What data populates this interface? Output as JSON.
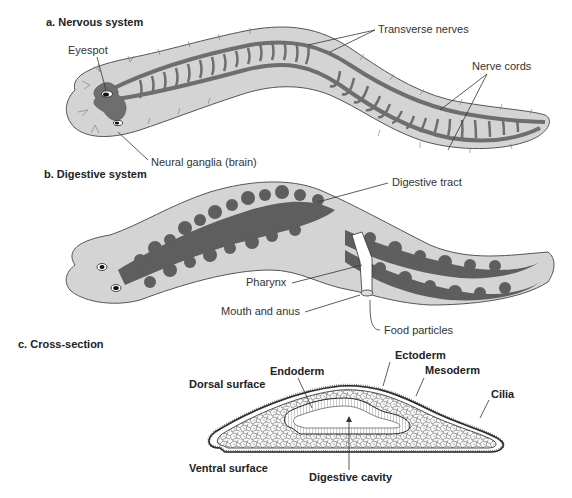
{
  "figure": {
    "colors": {
      "body_fill": "#d4d4d4",
      "body_stroke": "#555555",
      "nerve_fill": "#6e6e6e",
      "gut_fill": "#5e5e5e",
      "background": "#ffffff"
    },
    "panels": [
      {
        "id": "a",
        "title": "a. Nervous system",
        "labels": [
          "Eyespot",
          "Transverse nerves",
          "Nerve cords",
          "Neural ganglia (brain)"
        ]
      },
      {
        "id": "b",
        "title": "b. Digestive system",
        "labels": [
          "Digestive tract",
          "Pharynx",
          "Mouth and anus",
          "Food particles"
        ]
      },
      {
        "id": "c",
        "title": "c. Cross-section",
        "labels": [
          "Endoderm",
          "Ectoderm",
          "Mesoderm",
          "Cilia",
          "Dorsal surface",
          "Ventral surface",
          "Digestive cavity"
        ]
      }
    ]
  }
}
